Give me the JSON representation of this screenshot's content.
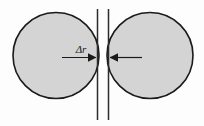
{
  "figure": {
    "background_color": "#fdfdfd",
    "width": 204,
    "height": 126,
    "annotation_label": "Δr",
    "annotation_label_name": "delta-r",
    "circle_fill_color": "#d4d4d4",
    "circle_stroke_color": "#1a1a1a",
    "line_color": "#2b2b2b",
    "arrow_color": "#1a1a1a",
    "left_circle": {
      "name": "left-circle",
      "cx": 56,
      "cy": 55.5,
      "r": 43
    },
    "right_circle": {
      "name": "right-circle",
      "cx": 150,
      "cy": 55.5,
      "r": 43
    },
    "left_vertical_line": {
      "name": "left-boundary-line",
      "x": 97.5,
      "y1": 9,
      "y2": 120
    },
    "right_vertical_line": {
      "name": "right-boundary-line",
      "x": 108.5,
      "y1": 9,
      "y2": 120
    },
    "left_arrow": {
      "name": "left-gap-arrow",
      "x_start": 62,
      "x_end": 96,
      "y": 57.5,
      "direction": "right"
    },
    "right_arrow": {
      "name": "right-gap-arrow",
      "x_start": 142,
      "x_end": 110,
      "y": 57.5,
      "direction": "left"
    },
    "label_position": {
      "x": 81,
      "y": 53
    }
  }
}
